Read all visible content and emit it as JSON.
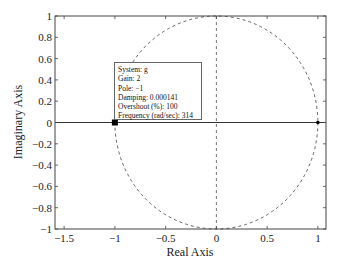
{
  "chart_data": {
    "type": "scatter",
    "title": "",
    "xlabel": "Real Axis",
    "ylabel": "Imaginary Axis",
    "xlim": [
      -1.59,
      1.08
    ],
    "ylim": [
      -1,
      1
    ],
    "xticks": [
      -1.5,
      -1,
      -0.5,
      0,
      0.5,
      1
    ],
    "xtick_labels": [
      "−1.5",
      "−1",
      "−0.5",
      "0",
      "0.5",
      "1"
    ],
    "yticks": [
      1,
      0.8,
      0.6,
      0.4,
      0.2,
      0,
      -0.2,
      -0.4,
      -0.6,
      -0.8,
      -1
    ],
    "ytick_labels": [
      "1",
      "0.8",
      "0.6",
      "0.4",
      "0.2",
      "0",
      "−0.2",
      "−0.4",
      "−0.6",
      "−0.8",
      "−1"
    ],
    "grid": false,
    "unit_circle": {
      "center": [
        0,
        0
      ],
      "radius": 1,
      "style": "dashed"
    },
    "imag_axis_line": {
      "x": 0,
      "style": "dashed"
    },
    "root_locus": {
      "from": [
        -1,
        0
      ],
      "to": [
        1,
        0
      ],
      "style": "solid"
    },
    "poles": [
      {
        "x": -1,
        "y": 0,
        "marker": "x-bold"
      }
    ],
    "zeros": [
      {
        "x": 1,
        "y": 0
      }
    ],
    "datatip": {
      "anchor": [
        -1,
        0
      ],
      "lines": [
        "System: g",
        "Gain: 2",
        "Pole: −1",
        "Damping: 0.000141",
        "Overshoot (%): 100",
        "Frequency (rad/sec): 314"
      ]
    }
  },
  "colors": {
    "axes": "#444444",
    "locus": "#333333",
    "dashed": "#555555",
    "marker": "#000000"
  }
}
